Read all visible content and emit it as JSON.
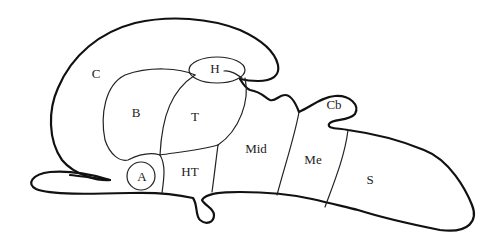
{
  "diagram": {
    "labels": {
      "C": "C",
      "B": "B",
      "T": "T",
      "H": "H",
      "A": "A",
      "HT": "HT",
      "Mid": "Mid",
      "Me": "Me",
      "S": "S",
      "Cb": "Cb"
    },
    "stroke_color": "#111111",
    "background": "#ffffff"
  }
}
